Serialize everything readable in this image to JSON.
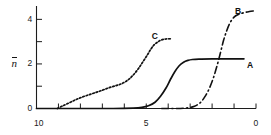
{
  "chart_data": {
    "type": "line",
    "title": "",
    "subtitle": "",
    "xlabel": "",
    "ylabel": "n̄",
    "ylabel_plain": "n-bar",
    "xlim": [
      10,
      0
    ],
    "ylim": [
      0,
      4.6
    ],
    "x_axis_reversed": true,
    "grid": false,
    "legend": "inline-curve-labels",
    "x_ticks": [
      10,
      9,
      8,
      7,
      6,
      5,
      4,
      3,
      2,
      1,
      0
    ],
    "x_tick_labels": [
      "10",
      "",
      "",
      "",
      "",
      "5",
      "",
      "",
      "",
      "",
      "0"
    ],
    "y_ticks": [
      0,
      1,
      2,
      3,
      4
    ],
    "y_tick_labels": [
      "0",
      "",
      "2",
      "",
      "4"
    ],
    "annotations": [
      {
        "text": "A",
        "x": 0.55,
        "y": 2.0
      },
      {
        "text": "B",
        "x": 0.65,
        "y": 4.5
      },
      {
        "text": "C",
        "x": 4.55,
        "y": 3.35
      }
    ],
    "series": [
      {
        "name": "A",
        "label": "A",
        "style": "solid",
        "color": "#111111",
        "points": [
          [
            10.0,
            0.0
          ],
          [
            8.0,
            0.0
          ],
          [
            6.5,
            0.0
          ],
          [
            5.6,
            0.02
          ],
          [
            5.2,
            0.05
          ],
          [
            4.9,
            0.12
          ],
          [
            4.6,
            0.28
          ],
          [
            4.35,
            0.55
          ],
          [
            4.1,
            0.92
          ],
          [
            3.9,
            1.3
          ],
          [
            3.7,
            1.65
          ],
          [
            3.5,
            1.92
          ],
          [
            3.3,
            2.08
          ],
          [
            3.1,
            2.16
          ],
          [
            2.9,
            2.2
          ],
          [
            2.6,
            2.22
          ],
          [
            2.0,
            2.23
          ],
          [
            1.2,
            2.23
          ],
          [
            0.55,
            2.23
          ]
        ]
      },
      {
        "name": "B",
        "label": "B",
        "style": "dash-dot",
        "color": "#111111",
        "points": [
          [
            4.3,
            0.0
          ],
          [
            3.6,
            0.0
          ],
          [
            3.1,
            0.03
          ],
          [
            2.8,
            0.1
          ],
          [
            2.55,
            0.25
          ],
          [
            2.35,
            0.5
          ],
          [
            2.15,
            0.85
          ],
          [
            1.95,
            1.35
          ],
          [
            1.78,
            1.9
          ],
          [
            1.62,
            2.5
          ],
          [
            1.48,
            3.05
          ],
          [
            1.33,
            3.5
          ],
          [
            1.18,
            3.85
          ],
          [
            1.0,
            4.1
          ],
          [
            0.8,
            4.22
          ],
          [
            0.55,
            4.3
          ],
          [
            0.3,
            4.35
          ],
          [
            0.1,
            4.38
          ]
        ]
      },
      {
        "name": "C",
        "label": "C",
        "style": "dotted",
        "color": "#111111",
        "points": [
          [
            9.05,
            0.0
          ],
          [
            8.8,
            0.12
          ],
          [
            8.5,
            0.26
          ],
          [
            8.2,
            0.4
          ],
          [
            7.9,
            0.52
          ],
          [
            7.6,
            0.62
          ],
          [
            7.3,
            0.72
          ],
          [
            7.0,
            0.82
          ],
          [
            6.7,
            0.93
          ],
          [
            6.4,
            1.02
          ],
          [
            6.15,
            1.1
          ],
          [
            5.95,
            1.2
          ],
          [
            5.75,
            1.35
          ],
          [
            5.55,
            1.55
          ],
          [
            5.35,
            1.8
          ],
          [
            5.15,
            2.1
          ],
          [
            4.95,
            2.4
          ],
          [
            4.78,
            2.68
          ],
          [
            4.62,
            2.88
          ],
          [
            4.45,
            3.0
          ],
          [
            4.3,
            3.08
          ],
          [
            4.1,
            3.12
          ],
          [
            3.9,
            3.13
          ]
        ]
      }
    ]
  },
  "axes": {
    "y_title": "n",
    "y_title_overline": true
  },
  "labels": {
    "curve_a": "A",
    "curve_b": "B",
    "curve_c": "C",
    "y_tick_0": "0",
    "y_tick_2": "2",
    "y_tick_4": "4",
    "x_tick_10": "10",
    "x_tick_5": "5",
    "x_tick_0": "0"
  }
}
